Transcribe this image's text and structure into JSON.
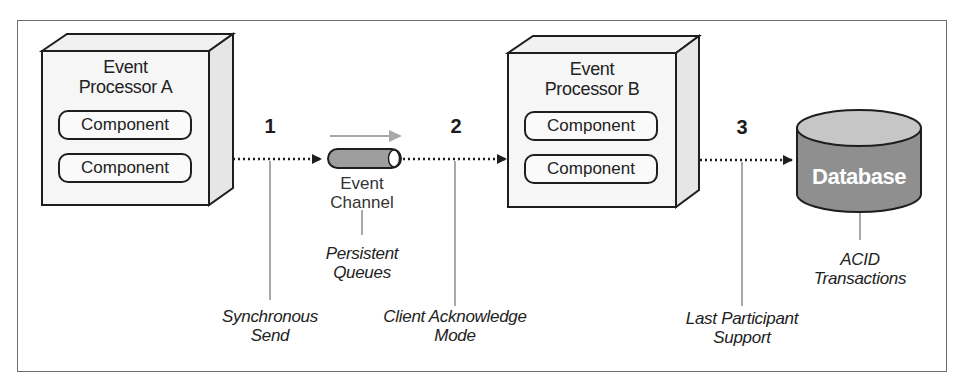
{
  "diagram": {
    "title": "",
    "nodes": {
      "processor_a": {
        "title_line1": "Event",
        "title_line2": "Processor A",
        "components": [
          "Component",
          "Component"
        ]
      },
      "event_channel": {
        "label_line1": "Event",
        "label_line2": "Channel",
        "note_line1": "Persistent",
        "note_line2": "Queues"
      },
      "processor_b": {
        "title_line1": "Event",
        "title_line2": "Processor B",
        "components": [
          "Component",
          "Component"
        ]
      },
      "database": {
        "label": "Database",
        "note_line1": "ACID",
        "note_line2": "Transactions"
      }
    },
    "steps": [
      {
        "number": "1",
        "note_line1": "Synchronous",
        "note_line2": "Send"
      },
      {
        "number": "2",
        "note_line1": "Client Acknowledge",
        "note_line2": "Mode"
      },
      {
        "number": "3",
        "note_line1": "Last Participant",
        "note_line2": "Support"
      }
    ],
    "edges": [
      {
        "from": "processor_a",
        "to": "event_channel",
        "style": "dotted-arrow",
        "step": "1"
      },
      {
        "from": "event_channel",
        "to": "processor_b",
        "style": "dotted-arrow",
        "step": "2"
      },
      {
        "from": "processor_b",
        "to": "database",
        "style": "dotted-arrow",
        "step": "3"
      }
    ],
    "colors": {
      "line": "#1e1e1e",
      "box_fill": "#f4f4f4",
      "channel_fill": "#9a9a9a",
      "flow_arrow": "#a8a8a8",
      "db_top": "#c4c4c4",
      "db_body": "#8f8f8f",
      "frame": "#6e6e6e"
    }
  }
}
